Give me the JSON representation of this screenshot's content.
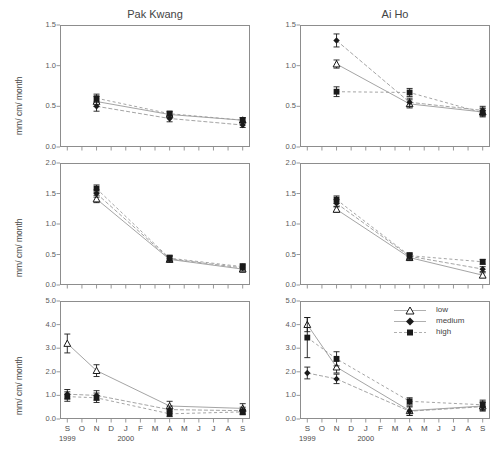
{
  "figure": {
    "columns": [
      {
        "id": "pak-kwang",
        "title": "Pak Kwang"
      },
      {
        "id": "ai-ho",
        "title": "Ai Ho"
      }
    ],
    "y_axis_label": "mm/ cm/ month",
    "species_rows": [
      "Avicennia alba",
      "Rhizophora mucronata",
      "Sonneratia caseolaris"
    ],
    "x_ticks": [
      "S",
      "O",
      "N",
      "D",
      "J",
      "F",
      "M",
      "A",
      "M",
      "J",
      "J",
      "A",
      "S"
    ],
    "year_labels": [
      {
        "text": "1999",
        "under_tick": "S"
      },
      {
        "text": "2000",
        "under_tick": "J"
      }
    ],
    "legend": {
      "position": "top-right of bottom-right panel",
      "items": [
        {
          "label": "low",
          "marker": "triangle-open-icon"
        },
        {
          "label": "medium",
          "marker": "diamond-filled-icon"
        },
        {
          "label": "high",
          "marker": "square-filled-icon"
        }
      ]
    },
    "colors": {
      "axis": "#8d8d8d",
      "marker": "#1a1a1a",
      "text": "#444444",
      "line": "#9a9a9a"
    }
  },
  "chart_data": {
    "type": "scatter",
    "ylabel": "mm/ cm/ month",
    "xlabel": "",
    "grid": false,
    "legend_position": "inside-bottom-right-panel-top-right",
    "x": [
      "S",
      "O",
      "N",
      "D",
      "J",
      "F",
      "M",
      "A",
      "M",
      "J",
      "J",
      "A",
      "S"
    ],
    "x_note": "S 1999 through S 2000; measurements taken at N, A and S only (plus S 1999 in Sonneratia panels)",
    "panels": [
      {
        "site": "Pak Kwang",
        "species": "Avicennia alba",
        "ylim": [
          0.0,
          1.5
        ],
        "yticks": [
          "0.0",
          "0.5",
          "1.0",
          "1.5"
        ],
        "series": [
          {
            "name": "low",
            "marker": "triangle-open",
            "points": [
              {
                "x": "N",
                "y": 0.56,
                "err": 0.06
              },
              {
                "x": "A",
                "y": 0.4,
                "err": 0.03
              },
              {
                "x": "S",
                "y": 0.33,
                "err": 0.03
              }
            ]
          },
          {
            "name": "medium",
            "marker": "diamond-filled",
            "points": [
              {
                "x": "N",
                "y": 0.5,
                "err": 0.06
              },
              {
                "x": "A",
                "y": 0.35,
                "err": 0.04
              },
              {
                "x": "S",
                "y": 0.27,
                "err": 0.03
              }
            ]
          },
          {
            "name": "high",
            "marker": "square-filled",
            "points": [
              {
                "x": "N",
                "y": 0.6,
                "err": 0.05
              },
              {
                "x": "A",
                "y": 0.41,
                "err": 0.03
              },
              {
                "x": "S",
                "y": 0.33,
                "err": 0.03
              }
            ]
          }
        ]
      },
      {
        "site": "Ai Ho",
        "species": "Avicennia alba",
        "ylim": [
          0.0,
          1.5
        ],
        "yticks": [
          "0.0",
          "0.5",
          "1.0",
          "1.5"
        ],
        "series": [
          {
            "name": "low",
            "marker": "triangle-open",
            "points": [
              {
                "x": "N",
                "y": 1.02,
                "err": 0.05
              },
              {
                "x": "A",
                "y": 0.53,
                "err": 0.05
              },
              {
                "x": "S",
                "y": 0.43,
                "err": 0.05
              }
            ]
          },
          {
            "name": "medium",
            "marker": "diamond-filled",
            "points": [
              {
                "x": "N",
                "y": 1.31,
                "err": 0.08
              },
              {
                "x": "A",
                "y": 0.55,
                "err": 0.05
              },
              {
                "x": "S",
                "y": 0.45,
                "err": 0.05
              }
            ]
          },
          {
            "name": "high",
            "marker": "square-filled",
            "points": [
              {
                "x": "N",
                "y": 0.68,
                "err": 0.06
              },
              {
                "x": "A",
                "y": 0.67,
                "err": 0.05
              },
              {
                "x": "S",
                "y": 0.42,
                "err": 0.05
              }
            ]
          }
        ]
      },
      {
        "site": "Pak Kwang",
        "species": "Rhizophora mucronata",
        "ylim": [
          0.0,
          2.0
        ],
        "yticks": [
          "0.0",
          "0.5",
          "1.0",
          "1.5",
          "2.0"
        ],
        "series": [
          {
            "name": "low",
            "marker": "triangle-open",
            "points": [
              {
                "x": "N",
                "y": 1.41,
                "err": 0.06
              },
              {
                "x": "A",
                "y": 0.42,
                "err": 0.05
              },
              {
                "x": "S",
                "y": 0.26,
                "err": 0.05
              }
            ]
          },
          {
            "name": "medium",
            "marker": "diamond-filled",
            "points": [
              {
                "x": "N",
                "y": 1.5,
                "err": 0.06
              },
              {
                "x": "A",
                "y": 0.43,
                "err": 0.05
              },
              {
                "x": "S",
                "y": 0.28,
                "err": 0.05
              }
            ]
          },
          {
            "name": "high",
            "marker": "square-filled",
            "points": [
              {
                "x": "N",
                "y": 1.58,
                "err": 0.06
              },
              {
                "x": "A",
                "y": 0.44,
                "err": 0.05
              },
              {
                "x": "S",
                "y": 0.3,
                "err": 0.05
              }
            ]
          }
        ]
      },
      {
        "site": "Ai Ho",
        "species": "Rhizophora mucronata",
        "ylim": [
          0.0,
          2.0
        ],
        "yticks": [
          "0.0",
          "0.5",
          "1.0",
          "1.5",
          "2.0"
        ],
        "series": [
          {
            "name": "low",
            "marker": "triangle-open",
            "points": [
              {
                "x": "N",
                "y": 1.24,
                "err": 0.05
              },
              {
                "x": "A",
                "y": 0.45,
                "err": 0.05
              },
              {
                "x": "S",
                "y": 0.16,
                "err": 0.04
              }
            ]
          },
          {
            "name": "medium",
            "marker": "diamond-filled",
            "points": [
              {
                "x": "N",
                "y": 1.34,
                "err": 0.06
              },
              {
                "x": "A",
                "y": 0.47,
                "err": 0.05
              },
              {
                "x": "S",
                "y": 0.26,
                "err": 0.04
              }
            ]
          },
          {
            "name": "high",
            "marker": "square-filled",
            "points": [
              {
                "x": "N",
                "y": 1.4,
                "err": 0.06
              },
              {
                "x": "A",
                "y": 0.48,
                "err": 0.05
              },
              {
                "x": "S",
                "y": 0.38,
                "err": 0.04
              }
            ]
          }
        ]
      },
      {
        "site": "Pak Kwang",
        "species": "Sonneratia caseolaris",
        "ylim": [
          0.0,
          5.0
        ],
        "yticks": [
          "0.0",
          "1.0",
          "2.0",
          "3.0",
          "4.0",
          "5.0"
        ],
        "series": [
          {
            "name": "low",
            "marker": "triangle-open",
            "points": [
              {
                "x": "S",
                "y": 3.2,
                "err": 0.4
              },
              {
                "x": "N",
                "y": 2.05,
                "err": 0.25
              },
              {
                "x": "A",
                "y": 0.55,
                "err": 0.2
              },
              {
                "x": "S",
                "y": 0.45,
                "err": 0.2
              }
            ]
          },
          {
            "name": "medium",
            "marker": "diamond-filled",
            "points": [
              {
                "x": "S",
                "y": 1.05,
                "err": 0.2
              },
              {
                "x": "N",
                "y": 1.0,
                "err": 0.2
              },
              {
                "x": "A",
                "y": 0.4,
                "err": 0.15
              },
              {
                "x": "S",
                "y": 0.35,
                "err": 0.15
              }
            ]
          },
          {
            "name": "high",
            "marker": "square-filled",
            "points": [
              {
                "x": "S",
                "y": 0.95,
                "err": 0.2
              },
              {
                "x": "N",
                "y": 0.9,
                "err": 0.2
              },
              {
                "x": "A",
                "y": 0.22,
                "err": 0.12
              },
              {
                "x": "S",
                "y": 0.3,
                "err": 0.12
              }
            ]
          }
        ]
      },
      {
        "site": "Ai Ho",
        "species": "Sonneratia caseolaris",
        "ylim": [
          0.0,
          5.0
        ],
        "yticks": [
          "0.0",
          "1.0",
          "2.0",
          "3.0",
          "4.0",
          "5.0"
        ],
        "series": [
          {
            "name": "low",
            "marker": "triangle-open",
            "points": [
              {
                "x": "S",
                "y": 4.0,
                "err": 0.3
              },
              {
                "x": "N",
                "y": 2.2,
                "err": 0.25
              },
              {
                "x": "A",
                "y": 0.35,
                "err": 0.2
              },
              {
                "x": "S",
                "y": 0.55,
                "err": 0.2
              }
            ]
          },
          {
            "name": "medium",
            "marker": "diamond-filled",
            "points": [
              {
                "x": "S",
                "y": 1.95,
                "err": 0.25
              },
              {
                "x": "N",
                "y": 1.7,
                "err": 0.2
              },
              {
                "x": "A",
                "y": 0.33,
                "err": 0.18
              },
              {
                "x": "S",
                "y": 0.52,
                "err": 0.18
              }
            ]
          },
          {
            "name": "high",
            "marker": "square-filled",
            "points": [
              {
                "x": "S",
                "y": 3.45,
                "err": 0.85
              },
              {
                "x": "N",
                "y": 2.55,
                "err": 0.3
              },
              {
                "x": "A",
                "y": 0.75,
                "err": 0.15
              },
              {
                "x": "S",
                "y": 0.6,
                "err": 0.2
              }
            ]
          }
        ]
      }
    ]
  }
}
